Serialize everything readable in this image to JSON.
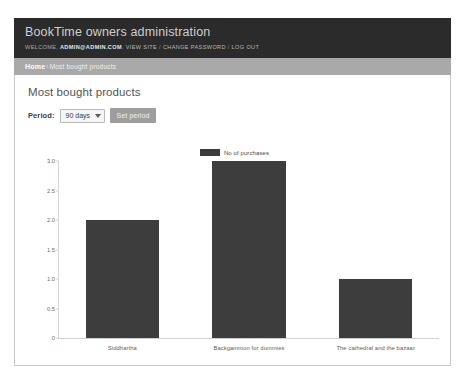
{
  "header": {
    "site_title": "BookTime owners administration",
    "welcome_prefix": "WELCOME,",
    "username": "ADMIN@ADMIN.COM",
    "username_suffix": ".",
    "view_site": "VIEW SITE",
    "sep1": "/",
    "change_password": "CHANGE PASSWORD",
    "sep2": "/",
    "log_out": "LOG OUT"
  },
  "breadcrumbs": {
    "home": "Home",
    "separator": "›",
    "current": "Most bought products"
  },
  "content": {
    "page_title": "Most bought products",
    "period_label": "Period:",
    "period_value": "90 days",
    "period_options": [
      "90 days"
    ],
    "set_period_label": "Set period"
  },
  "colors": {
    "header_bg": "#2b2b2b",
    "breadcrumb_bg": "#a9a9a9",
    "bar_color": "#3d3d3d",
    "button_bg": "#9e9e9e"
  },
  "chart_data": {
    "type": "bar",
    "title": "",
    "xlabel": "",
    "ylabel": "",
    "categories": [
      "Siddhartha",
      "Backgammon for dummies",
      "The cathedral and the bazaar"
    ],
    "values": [
      2.0,
      3.0,
      1.0
    ],
    "series": [
      {
        "name": "No of purchases",
        "values": [
          2.0,
          3.0,
          1.0
        ]
      }
    ],
    "legend": [
      "No of purchases"
    ],
    "legend_position": "top-center",
    "ylim": [
      0,
      3.0
    ],
    "yticks": [
      "0",
      "0.5",
      "1.0",
      "1.5",
      "2.0",
      "2.5",
      "3.0"
    ],
    "ytick_values": [
      0,
      0.5,
      1.0,
      1.5,
      2.0,
      2.5,
      3.0
    ],
    "grid": false
  }
}
